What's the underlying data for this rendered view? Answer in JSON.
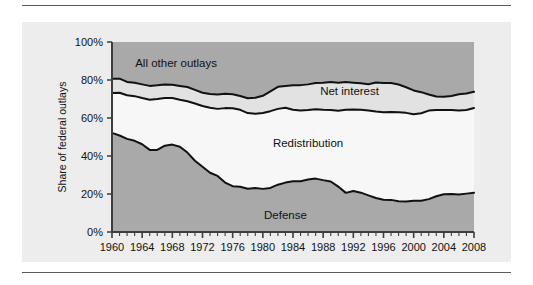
{
  "figure": {
    "background_color": "#ededed",
    "page_background": "#ffffff",
    "rule_color": "#5a5a5a"
  },
  "axes": {
    "y_axis_title": "Share of federal outlays",
    "y_ticks": [
      "0%",
      "20%",
      "40%",
      "60%",
      "80%",
      "100%"
    ],
    "y_tick_values": [
      0,
      20,
      40,
      60,
      80,
      100
    ],
    "x_ticks": [
      "1960",
      "1964",
      "1968",
      "1972",
      "1976",
      "1980",
      "1984",
      "1988",
      "1992",
      "1996",
      "2000",
      "2004",
      "2008"
    ],
    "x_tick_values": [
      1960,
      1964,
      1968,
      1972,
      1976,
      1980,
      1984,
      1988,
      1992,
      1996,
      2000,
      2004,
      2008
    ],
    "axis_line_color": "#3d3d3d",
    "minor_tick_interval_years": 1
  },
  "band_labels": {
    "all_other_outlays": "All other outlays",
    "net_interest": "Net interest",
    "redistribution": "Redistribution",
    "defense": "Defense"
  },
  "colors": {
    "defense_fill": "#a9a9a9",
    "redistribution_fill": "#f7f7f7",
    "net_interest_fill": "#e2e2e2",
    "all_other_outlays_fill": "#a9a9a9",
    "boundary_line": "#111111"
  },
  "chart_data": {
    "type": "area",
    "title": "",
    "subtitle": "",
    "xlabel": "",
    "ylabel": "Share of federal outlays",
    "xlim": [
      1960,
      2008
    ],
    "ylim": [
      0,
      100
    ],
    "stacked": true,
    "grid": false,
    "legend_position": "in-plot-annotations",
    "annotations": [
      {
        "text": "All other outlays",
        "x": 1968.5,
        "y": 89
      },
      {
        "text": "Net interest",
        "x": 1991.5,
        "y": 74
      },
      {
        "text": "Redistribution",
        "x": 1986.0,
        "y": 47
      },
      {
        "text": "Defense",
        "x": 1983.0,
        "y": 9
      }
    ],
    "x": [
      1960,
      1961,
      1962,
      1963,
      1964,
      1965,
      1966,
      1967,
      1968,
      1969,
      1970,
      1971,
      1972,
      1973,
      1974,
      1975,
      1976,
      1977,
      1978,
      1979,
      1980,
      1981,
      1982,
      1983,
      1984,
      1985,
      1986,
      1987,
      1988,
      1989,
      1990,
      1991,
      1992,
      1993,
      1994,
      1995,
      1996,
      1997,
      1998,
      1999,
      2000,
      2001,
      2002,
      2003,
      2004,
      2005,
      2006,
      2007,
      2008
    ],
    "series": [
      {
        "name": "Defense",
        "values": [
          52.2,
          50.8,
          49.0,
          48.0,
          46.2,
          43.2,
          43.2,
          45.4,
          46.0,
          44.9,
          41.8,
          37.5,
          34.3,
          31.2,
          29.5,
          26.0,
          24.1,
          23.8,
          22.8,
          23.1,
          22.7,
          23.2,
          24.9,
          26.0,
          26.7,
          26.7,
          27.6,
          28.1,
          27.3,
          26.6,
          23.9,
          20.6,
          21.6,
          20.7,
          19.3,
          17.9,
          17.0,
          16.9,
          16.2,
          16.1,
          16.5,
          16.4,
          17.3,
          18.8,
          19.9,
          20.0,
          19.7,
          20.2,
          20.7
        ]
      },
      {
        "name": "Redistribution",
        "values": [
          21.0,
          22.5,
          23.0,
          23.5,
          24.3,
          26.4,
          26.8,
          25.1,
          24.5,
          24.7,
          27.0,
          30.1,
          32.0,
          34.2,
          35.3,
          39.2,
          41.0,
          40.5,
          39.8,
          39.2,
          39.9,
          40.4,
          39.9,
          39.4,
          37.6,
          37.3,
          36.6,
          36.5,
          37.0,
          37.6,
          39.9,
          43.7,
          42.9,
          43.6,
          44.6,
          45.5,
          46.0,
          46.3,
          46.8,
          46.6,
          45.5,
          46.1,
          46.6,
          45.4,
          44.3,
          44.2,
          44.3,
          44.0,
          44.6
        ]
      },
      {
        "name": "Net interest",
        "values": [
          7.5,
          7.4,
          7.0,
          7.0,
          7.2,
          7.3,
          7.2,
          7.1,
          7.0,
          7.3,
          7.5,
          7.2,
          7.0,
          7.2,
          7.6,
          7.5,
          7.4,
          7.3,
          7.8,
          8.4,
          9.1,
          10.4,
          11.6,
          11.4,
          12.9,
          13.3,
          13.5,
          13.8,
          14.3,
          14.8,
          14.7,
          14.6,
          14.1,
          14.0,
          13.9,
          15.3,
          15.4,
          15.2,
          14.6,
          13.5,
          12.5,
          11.1,
          8.5,
          7.1,
          7.0,
          7.4,
          8.5,
          8.7,
          8.5
        ]
      },
      {
        "name": "All other outlays",
        "values": [
          19.3,
          19.3,
          21.0,
          21.5,
          22.3,
          23.1,
          22.8,
          22.4,
          22.5,
          23.1,
          23.7,
          25.2,
          26.7,
          27.4,
          27.6,
          27.3,
          27.5,
          28.4,
          29.6,
          29.3,
          28.3,
          26.0,
          23.6,
          23.2,
          22.8,
          22.7,
          22.3,
          21.6,
          21.4,
          21.0,
          21.5,
          21.1,
          21.4,
          21.7,
          22.2,
          21.3,
          21.6,
          21.6,
          22.4,
          23.8,
          25.5,
          26.4,
          27.6,
          28.7,
          28.8,
          28.4,
          27.5,
          27.1,
          26.2
        ]
      }
    ],
    "cumulative_boundaries": {
      "defense_top": [
        52.2,
        50.8,
        49.0,
        48.0,
        46.2,
        43.2,
        43.2,
        45.4,
        46.0,
        44.9,
        41.8,
        37.5,
        34.3,
        31.2,
        29.5,
        26.0,
        24.1,
        23.8,
        22.8,
        23.1,
        22.7,
        23.2,
        24.9,
        26.0,
        26.7,
        26.7,
        27.6,
        28.1,
        27.3,
        26.6,
        23.9,
        20.6,
        21.6,
        20.7,
        19.3,
        17.9,
        17.0,
        16.9,
        16.2,
        16.1,
        16.5,
        16.4,
        17.3,
        18.8,
        19.9,
        20.0,
        19.7,
        20.2,
        20.7
      ],
      "redistribution_top": [
        73.2,
        73.3,
        72.0,
        71.5,
        70.5,
        69.6,
        70.0,
        70.5,
        70.5,
        69.6,
        68.8,
        67.6,
        66.3,
        65.4,
        64.8,
        65.2,
        65.1,
        64.3,
        62.6,
        62.3,
        62.6,
        63.6,
        64.8,
        65.4,
        64.3,
        64.0,
        64.2,
        64.6,
        64.3,
        64.2,
        63.8,
        64.3,
        64.5,
        64.3,
        63.9,
        63.4,
        63.0,
        63.2,
        63.0,
        62.7,
        62.0,
        62.5,
        63.9,
        64.2,
        64.2,
        64.2,
        64.0,
        64.2,
        65.3
      ],
      "net_interest_top": [
        80.7,
        80.7,
        79.0,
        78.5,
        77.7,
        76.9,
        77.2,
        77.6,
        77.5,
        76.9,
        76.3,
        74.8,
        73.3,
        72.6,
        72.4,
        72.7,
        72.5,
        71.6,
        70.4,
        70.7,
        71.7,
        74.0,
        76.4,
        76.8,
        77.2,
        77.3,
        77.7,
        78.4,
        78.6,
        79.0,
        78.5,
        78.9,
        78.6,
        78.3,
        77.8,
        78.7,
        78.4,
        78.4,
        77.6,
        76.2,
        74.5,
        73.6,
        72.4,
        71.3,
        71.2,
        71.6,
        72.5,
        72.9,
        73.8
      ]
    }
  }
}
